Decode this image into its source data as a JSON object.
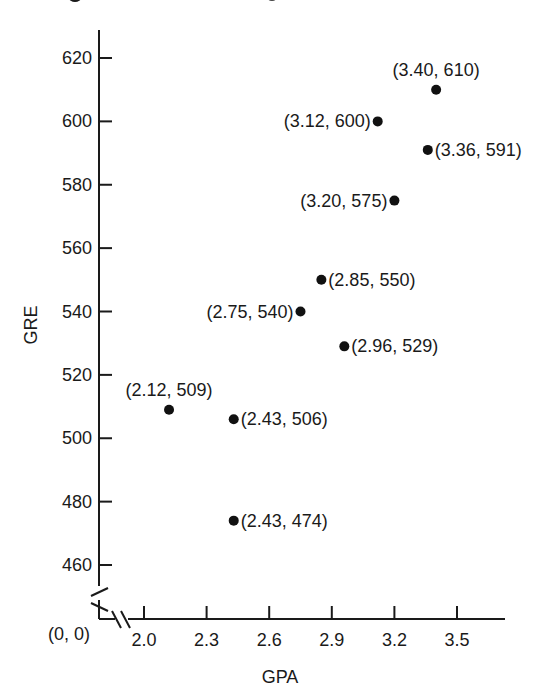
{
  "chart_data": {
    "type": "scatter",
    "title": "",
    "xlabel": "GPA",
    "ylabel": "GRE",
    "origin_label": "(0, 0)",
    "axis_breaks": {
      "x": true,
      "y": true
    },
    "grid": false,
    "xlim": [
      1.85,
      3.73
    ],
    "ylim": [
      445,
      630
    ],
    "x_ticks": [
      2.0,
      2.3,
      2.6,
      2.9,
      3.2,
      3.5
    ],
    "x_tick_labels": [
      "2.0",
      "2.3",
      "2.6",
      "2.9",
      "3.2",
      "3.5"
    ],
    "y_ticks": [
      460,
      480,
      500,
      520,
      540,
      560,
      580,
      600,
      620
    ],
    "y_tick_labels": [
      "460",
      "480",
      "500",
      "520",
      "540",
      "560",
      "580",
      "600",
      "620"
    ],
    "points": [
      {
        "x": 3.4,
        "y": 610,
        "label": "(3.40, 610)",
        "label_pos": "above"
      },
      {
        "x": 3.12,
        "y": 600,
        "label": "(3.12, 600)",
        "label_pos": "left"
      },
      {
        "x": 3.36,
        "y": 591,
        "label": "(3.36, 591)",
        "label_pos": "right"
      },
      {
        "x": 3.2,
        "y": 575,
        "label": "(3.20, 575)",
        "label_pos": "left"
      },
      {
        "x": 2.85,
        "y": 550,
        "label": "(2.85, 550)",
        "label_pos": "right"
      },
      {
        "x": 2.75,
        "y": 540,
        "label": "(2.75, 540)",
        "label_pos": "left"
      },
      {
        "x": 2.96,
        "y": 529,
        "label": "(2.96, 529)",
        "label_pos": "right"
      },
      {
        "x": 2.12,
        "y": 509,
        "label": "(2.12, 509)",
        "label_pos": "above"
      },
      {
        "x": 2.43,
        "y": 506,
        "label": "(2.43, 506)",
        "label_pos": "right"
      },
      {
        "x": 2.43,
        "y": 474,
        "label": "(2.43, 474)",
        "label_pos": "right"
      }
    ]
  },
  "colors": {
    "ink": "#1a1a1a",
    "background": "#ffffff"
  }
}
